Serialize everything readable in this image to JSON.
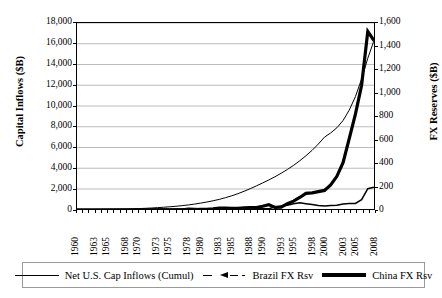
{
  "chart_data": {
    "type": "line",
    "title": "",
    "xlabel": "",
    "ylabel": "Capital Inflows ($B)",
    "y2label": "FX Reserves ($B)",
    "grid": true,
    "legend_position": "bottom",
    "xlim": [
      1960,
      2008
    ],
    "ylim": [
      0,
      18000
    ],
    "y2lim": [
      0,
      1600
    ],
    "ytick_labels": [
      "18,000",
      "16,000",
      "14,000",
      "12,000",
      "10,000",
      "8,000",
      "6,000",
      "4,000",
      "2,000",
      "0"
    ],
    "ytick_values": [
      18000,
      16000,
      14000,
      12000,
      10000,
      8000,
      6000,
      4000,
      2000,
      0
    ],
    "y2tick_labels": [
      "1,600",
      "1,400",
      "1,200",
      "1,000",
      "800",
      "600",
      "400",
      "200",
      "0"
    ],
    "y2tick_values": [
      1600,
      1400,
      1200,
      1000,
      800,
      600,
      400,
      200,
      0
    ],
    "xtick_labels": [
      "1960",
      "1963",
      "1965",
      "1968",
      "1970",
      "1973",
      "1975",
      "1978",
      "1980",
      "1983",
      "1985",
      "1988",
      "1990",
      "1993",
      "1995",
      "1998",
      "2000",
      "2003",
      "2005",
      "2008"
    ],
    "xtick_values": [
      1960,
      1963,
      1965,
      1968,
      1970,
      1973,
      1975,
      1978,
      1980,
      1983,
      1985,
      1988,
      1990,
      1993,
      1995,
      1998,
      2000,
      2003,
      2005,
      2008
    ],
    "x": [
      1960,
      1961,
      1962,
      1963,
      1964,
      1965,
      1966,
      1967,
      1968,
      1969,
      1970,
      1971,
      1972,
      1973,
      1974,
      1975,
      1976,
      1977,
      1978,
      1979,
      1980,
      1981,
      1982,
      1983,
      1984,
      1985,
      1986,
      1987,
      1988,
      1989,
      1990,
      1991,
      1992,
      1993,
      1994,
      1995,
      1996,
      1997,
      1998,
      1999,
      2000,
      2001,
      2002,
      2003,
      2004,
      2005,
      2006,
      2007,
      2008
    ],
    "series": [
      {
        "name": "Net U.S. Cap Inflows (Cumul)",
        "axis": "left",
        "style": "thin-solid",
        "color": "#000000",
        "values": [
          5,
          10,
          16,
          23,
          30,
          38,
          47,
          58,
          72,
          90,
          110,
          135,
          165,
          200,
          240,
          285,
          335,
          395,
          465,
          545,
          640,
          745,
          865,
          1000,
          1160,
          1340,
          1545,
          1780,
          2030,
          2300,
          2580,
          2870,
          3180,
          3520,
          3880,
          4280,
          4720,
          5200,
          5730,
          6330,
          7000,
          7400,
          7900,
          8600,
          9600,
          10900,
          12600,
          14600,
          16300
        ]
      },
      {
        "name": "Brazil FX Rsv",
        "axis": "right",
        "style": "dashed-marker",
        "color": "#000000",
        "values": [
          0.5,
          0.6,
          0.4,
          0.4,
          0.3,
          0.5,
          0.4,
          0.2,
          0.3,
          0.6,
          1.2,
          1.7,
          4.2,
          6.4,
          5.3,
          4.0,
          6.5,
          7.3,
          11.9,
          9.7,
          6.9,
          7.5,
          4.0,
          4.6,
          12.0,
          11.6,
          6.8,
          7.5,
          9.1,
          9.7,
          9.0,
          9.4,
          23.8,
          32.2,
          38.8,
          51.8,
          60.1,
          52.2,
          44.6,
          36.3,
          33.0,
          35.9,
          37.8,
          49.3,
          52.9,
          53.8,
          85.8,
          180.3,
          193.8
        ]
      },
      {
        "name": "China FX Rsv",
        "axis": "right",
        "style": "thick-solid",
        "color": "#000000",
        "values": [
          0,
          0,
          0,
          0,
          0,
          0,
          0,
          0,
          0,
          0,
          0,
          0,
          0,
          0,
          0,
          0,
          0,
          0,
          1.6,
          2.2,
          2.5,
          2.7,
          6.9,
          14.9,
          14.4,
          12.7,
          11.5,
          16.3,
          18.5,
          17.9,
          29.6,
          43.7,
          19.4,
          21.2,
          51.6,
          73.6,
          105.0,
          139.9,
          145.0,
          154.7,
          165.6,
          212.2,
          286.4,
          403.3,
          609.9,
          818.9,
          1066.3,
          1528.2,
          1450.0
        ]
      }
    ]
  },
  "legend": {
    "items": [
      {
        "label": "Net U.S. Cap Inflows (Cumul)",
        "key": "thin-line-key"
      },
      {
        "label": "Brazil FX Rsv",
        "key": "dashed-marker-key"
      },
      {
        "label": "China FX Rsv",
        "key": "thick-line-key"
      }
    ]
  },
  "colors": {
    "ink": "#000000",
    "gridline": "#8c8c8c",
    "legend_border": "#9a9a9a",
    "background": "#ffffff"
  }
}
